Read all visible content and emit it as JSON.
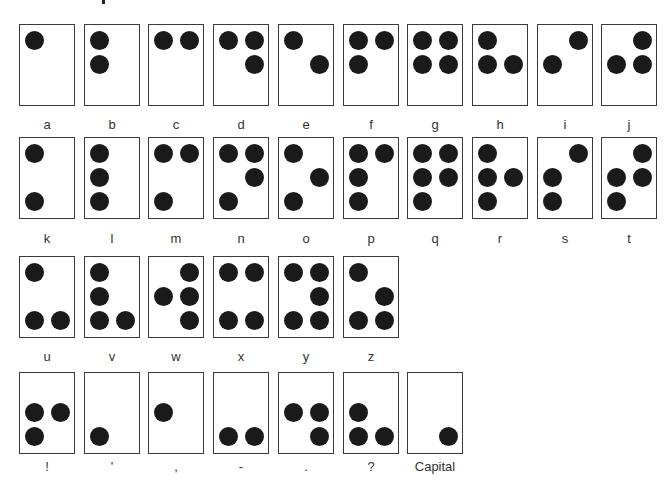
{
  "diagram": {
    "title_fragment": ".",
    "rows": [
      {
        "cells": [
          {
            "label": "a",
            "dots": [
              1
            ]
          },
          {
            "label": "b",
            "dots": [
              1,
              2
            ]
          },
          {
            "label": "c",
            "dots": [
              1,
              4
            ]
          },
          {
            "label": "d",
            "dots": [
              1,
              4,
              5
            ]
          },
          {
            "label": "e",
            "dots": [
              1,
              5
            ]
          },
          {
            "label": "f",
            "dots": [
              1,
              2,
              4
            ]
          },
          {
            "label": "g",
            "dots": [
              1,
              2,
              4,
              5
            ]
          },
          {
            "label": "h",
            "dots": [
              1,
              2,
              5
            ]
          },
          {
            "label": "i",
            "dots": [
              2,
              4
            ]
          },
          {
            "label": "j",
            "dots": [
              2,
              4,
              5
            ]
          }
        ]
      },
      {
        "cells": [
          {
            "label": "k",
            "dots": [
              1,
              3
            ]
          },
          {
            "label": "l",
            "dots": [
              1,
              2,
              3
            ]
          },
          {
            "label": "m",
            "dots": [
              1,
              3,
              4
            ]
          },
          {
            "label": "n",
            "dots": [
              1,
              3,
              4,
              5
            ]
          },
          {
            "label": "o",
            "dots": [
              1,
              3,
              5
            ]
          },
          {
            "label": "p",
            "dots": [
              1,
              2,
              3,
              4
            ]
          },
          {
            "label": "q",
            "dots": [
              1,
              2,
              3,
              4,
              5
            ]
          },
          {
            "label": "r",
            "dots": [
              1,
              2,
              3,
              5
            ]
          },
          {
            "label": "s",
            "dots": [
              2,
              3,
              4
            ]
          },
          {
            "label": "t",
            "dots": [
              2,
              3,
              4,
              5
            ]
          }
        ]
      },
      {
        "cells": [
          {
            "label": "u",
            "dots": [
              1,
              3,
              6
            ]
          },
          {
            "label": "v",
            "dots": [
              1,
              2,
              3,
              6
            ]
          },
          {
            "label": "w",
            "dots": [
              2,
              4,
              5,
              6
            ]
          },
          {
            "label": "x",
            "dots": [
              1,
              3,
              4,
              6
            ]
          },
          {
            "label": "y",
            "dots": [
              1,
              3,
              4,
              5,
              6
            ]
          },
          {
            "label": "z",
            "dots": [
              1,
              3,
              5,
              6
            ]
          }
        ]
      },
      {
        "cells": [
          {
            "label": "!",
            "dots": [
              2,
              3,
              5
            ]
          },
          {
            "label": "'",
            "dots": [
              3
            ]
          },
          {
            "label": ",",
            "dots": [
              2
            ]
          },
          {
            "label": "-",
            "dots": [
              3,
              6
            ]
          },
          {
            "label": ".",
            "dots": [
              2,
              5,
              6
            ]
          },
          {
            "label": "?",
            "dots": [
              2,
              3,
              6
            ]
          },
          {
            "label": "Capital",
            "dots": [
              6
            ]
          }
        ]
      }
    ]
  },
  "colors": {
    "dot": "#1a1a1a",
    "border": "#3a3a3a",
    "label": "#333333",
    "background": "#ffffff"
  }
}
